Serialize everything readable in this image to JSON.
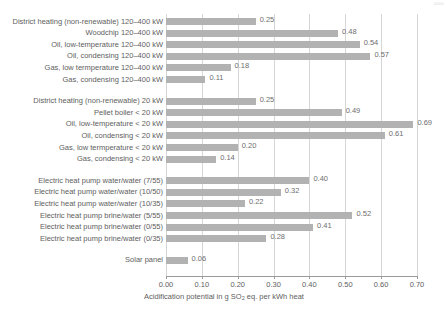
{
  "corner_mark": "0000",
  "chart_data": {
    "type": "bar",
    "orientation": "horizontal",
    "title": "",
    "xlabel_prefix": "Acidification potential in g SO",
    "xlabel_sub": "2",
    "xlabel_suffix": " eq. per kWh heat",
    "ylabel": "",
    "xlim": [
      0.0,
      0.7
    ],
    "grid": "vertical",
    "legend": "none",
    "bar_color": "#b2b2b2",
    "tick_labels": [
      "0.00",
      "0.10",
      "0.20",
      "0.30",
      "0.40",
      "0.50",
      "0.60",
      "0.70"
    ],
    "tick_values": [
      0.0,
      0.1,
      0.2,
      0.3,
      0.4,
      0.5,
      0.6,
      0.7
    ],
    "categories": [
      "District heating (non-renewable) 120–400 kW",
      "Woodchip 120–400 kW",
      "Oil, low-temperature 120–400 kW",
      "Oil, condensing 120–400 kW",
      "Gas, low termperature 120–400 kW",
      "Gas, condensing 120–400 kW",
      "District heating (non-renewable) 20 kW",
      "Pellet boiler < 20 kW",
      "Oil, low-temperature < 20 kW",
      "Oil, condensing < 20 kW",
      "Gas, low termperature < 20 kW",
      "Gas, condensing < 20 kW",
      "Electric heat pump water/water (7/55)",
      "Electric heat pump water/water (10/50)",
      "Electric heat pump water/water (10/35)",
      "Electric heat pump brine/water (5/55)",
      "Electric heat pump brine/water (0/55)",
      "Electric heat pump brine/water (0/35)",
      "Solar panel"
    ],
    "values": [
      0.25,
      0.48,
      0.54,
      0.57,
      0.18,
      0.11,
      0.25,
      0.49,
      0.69,
      0.61,
      0.2,
      0.14,
      0.4,
      0.32,
      0.22,
      0.52,
      0.41,
      0.28,
      0.06
    ],
    "value_labels": [
      "0.25",
      "0.48",
      "0.54",
      "0.57",
      "0.18",
      "0.11",
      "0.25",
      "0.49",
      "0.69",
      "0.61",
      "0.20",
      "0.14",
      "0.40",
      "0.32",
      "0.22",
      "0.52",
      "0.41",
      "0.28",
      "0.06"
    ],
    "groups": [
      {
        "name": "120-400 kW boilers",
        "start": 0,
        "count": 6
      },
      {
        "name": "under 20 kW boilers",
        "start": 6,
        "count": 6
      },
      {
        "name": "electric heat pumps",
        "start": 12,
        "count": 6
      },
      {
        "name": "solar",
        "start": 18,
        "count": 1
      }
    ]
  }
}
